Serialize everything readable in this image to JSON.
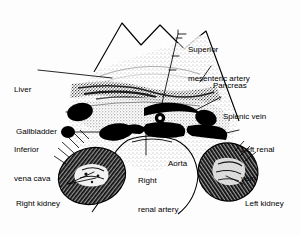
{
  "figure": {
    "background_color": "#fdfdfd",
    "ink_color": "#000000",
    "width": 301,
    "height": 236
  },
  "labels": [
    {
      "id": "superior-mesenteric-artery",
      "text": "Superior\nmesenteric artery",
      "line1": "Superior",
      "line2": "mesenteric artery",
      "x": 188,
      "y": 26,
      "align": "left"
    },
    {
      "id": "pancreas",
      "text": "Pancreas",
      "line1": "Pancreas",
      "x": 213,
      "y": 62,
      "align": "left"
    },
    {
      "id": "liver",
      "text": "Liver",
      "line1": "Liver",
      "x": 14,
      "y": 66,
      "align": "left"
    },
    {
      "id": "splenic-vein",
      "text": "Splenic vein",
      "line1": "Splenic vein",
      "x": 223,
      "y": 93,
      "align": "left"
    },
    {
      "id": "gallbladder",
      "text": "Gallbladder",
      "line1": "Gallbladder",
      "x": 16,
      "y": 108,
      "align": "left"
    },
    {
      "id": "inferior-vena-cava",
      "text": "Inferior\nvena cava",
      "line1": "Inferior",
      "line2": "vena cava",
      "x": 14,
      "y": 126,
      "align": "left"
    },
    {
      "id": "left-renal-vein",
      "text": "Left renal\nvein",
      "line1": "Left renal",
      "line2": "vein",
      "x": 241,
      "y": 126,
      "align": "left"
    },
    {
      "id": "aorta",
      "text": "Aorta",
      "line1": "Aorta",
      "x": 168,
      "y": 140,
      "align": "left"
    },
    {
      "id": "right-renal-artery",
      "text": "Right\nrenal artery",
      "line1": "Right",
      "line2": "renal artery",
      "x": 138,
      "y": 157,
      "align": "left"
    },
    {
      "id": "left-kidney",
      "text": "Left kidney",
      "line1": "Left kidney",
      "x": 245,
      "y": 180,
      "align": "left"
    },
    {
      "id": "right-kidney",
      "text": "Right kidney",
      "line1": "Right kidney",
      "x": 16,
      "y": 180,
      "align": "left"
    }
  ],
  "structures": [
    {
      "id": "scan-sector-outline",
      "name": "ultrasound sector outline"
    },
    {
      "id": "liver-parenchyma",
      "name": "liver speckle region"
    },
    {
      "id": "pancreas-body",
      "name": "pancreas stippled band"
    },
    {
      "id": "gallbladder-lumen",
      "name": "gallbladder anechoic oval"
    },
    {
      "id": "inferior-vena-cava-lumen",
      "name": "IVC anechoic oval"
    },
    {
      "id": "aorta-lumen",
      "name": "aorta anechoic oval"
    },
    {
      "id": "splenic-vein-lumen",
      "name": "splenic vein anechoic band"
    },
    {
      "id": "left-renal-vein-lumen",
      "name": "left renal vein anechoic band"
    },
    {
      "id": "superior-mesenteric-artery-lumen",
      "name": "SMA small round lumen"
    },
    {
      "id": "right-kidney-body",
      "name": "right kidney with echogenic sinus"
    },
    {
      "id": "left-kidney-body",
      "name": "left kidney with echogenic sinus"
    },
    {
      "id": "spine-shadow-outline",
      "name": "vertebral body outline"
    }
  ]
}
